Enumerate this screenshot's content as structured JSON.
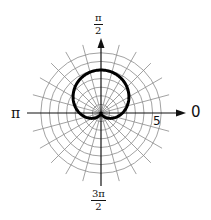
{
  "chart_data": {
    "type": "line",
    "subtype": "polar",
    "title": "",
    "equation": "r = 2.5(1 + sin θ)",
    "series": [
      {
        "name": "cardioid",
        "theta_deg": [
          0,
          30,
          60,
          90,
          120,
          150,
          180,
          210,
          240,
          270,
          300,
          330,
          360
        ],
        "r": [
          2.5,
          3.75,
          4.67,
          5.0,
          4.67,
          3.75,
          2.5,
          1.25,
          0.33,
          0,
          0.33,
          1.25,
          2.5
        ]
      }
    ],
    "angle_labels": [
      {
        "angle": "0",
        "text": "0"
      },
      {
        "angle": "π/2",
        "num": "π",
        "den": "2"
      },
      {
        "angle": "π",
        "text": "π"
      },
      {
        "angle": "3π/2",
        "num": "3π",
        "den": "2"
      }
    ],
    "radial_tick_label": "5",
    "rings": 7,
    "spokes_every_deg": 15,
    "grid": true,
    "colors": {
      "grid": "#8a8a8a",
      "axis": "#111111",
      "curve": "#000000"
    }
  },
  "labels": {
    "zero": "0",
    "pi": "π",
    "half_pi_num": "π",
    "half_pi_den": "2",
    "three_half_pi_num": "3π",
    "three_half_pi_den": "2",
    "radial_five": "5"
  }
}
